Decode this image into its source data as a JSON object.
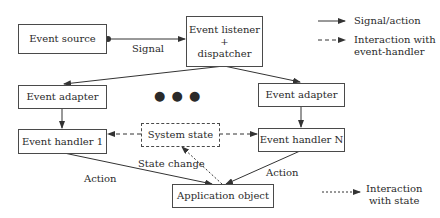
{
  "diagram": {
    "nodes": {
      "event_source": "Event source",
      "listener_line1": "Event listener",
      "listener_plus": "+",
      "listener_line2": "dispatcher",
      "adapter_left": "Event adapter",
      "adapter_right": "Event adapter",
      "handler_1": "Event handler 1",
      "handler_n": "Event handler N",
      "system_state": "System state",
      "application_object": "Application object"
    },
    "edge_labels": {
      "signal": "Signal",
      "state_change": "State change",
      "action_left": "Action",
      "action_right": "Action"
    },
    "ellipsis": "● ● ●",
    "legend": {
      "signal_action": "Signal/action",
      "interaction_handler_1": "Interaction with",
      "interaction_handler_2": "event-handler",
      "interaction_state_1": "Interaction",
      "interaction_state_2": "with state"
    },
    "colors": {
      "line": "#3a3a3a",
      "text": "#2a2a2a",
      "background": "#ffffff"
    }
  }
}
